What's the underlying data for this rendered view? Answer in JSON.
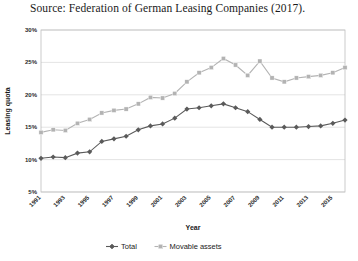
{
  "source": {
    "caption": "Source: Federation of German Leasing Companies (2017)."
  },
  "chart_data": {
    "type": "line",
    "title": "",
    "xlabel": "Year",
    "ylabel": "Leasing quota",
    "ylim": [
      5,
      30
    ],
    "ytick_labels": [
      "30%",
      "25%",
      "20%",
      "15%",
      "10%",
      "5%"
    ],
    "ytick_values": [
      30,
      25,
      20,
      15,
      10,
      5
    ],
    "grid": true,
    "legend_position": "bottom",
    "x_tick_step": 2,
    "x": [
      1991,
      1992,
      1993,
      1994,
      1995,
      1996,
      1997,
      1998,
      1999,
      2000,
      2001,
      2002,
      2003,
      2004,
      2005,
      2006,
      2007,
      2008,
      2009,
      2010,
      2011,
      2012,
      2013,
      2014,
      2015,
      2016
    ],
    "xtick_labels": [
      "1991",
      "1993",
      "1995",
      "1997",
      "1999",
      "2001",
      "2003",
      "2005",
      "2007",
      "2009",
      "2011",
      "2013",
      "2015"
    ],
    "series": [
      {
        "name": "Total",
        "color": "#5a5a5a",
        "marker": "diamond",
        "values": [
          10.2,
          10.4,
          10.3,
          11.0,
          11.2,
          12.8,
          13.2,
          13.6,
          14.6,
          15.2,
          15.5,
          16.4,
          17.8,
          18.0,
          18.3,
          18.6,
          18.0,
          17.4,
          16.2,
          15.0,
          15.0,
          15.0,
          15.1,
          15.2,
          15.6,
          16.1
        ]
      },
      {
        "name": "Movable assets",
        "color": "#b3b3b3",
        "marker": "square",
        "values": [
          14.2,
          14.6,
          14.5,
          15.6,
          16.2,
          17.2,
          17.6,
          17.8,
          18.6,
          19.6,
          19.5,
          20.2,
          22.0,
          23.4,
          24.2,
          25.6,
          24.6,
          23.0,
          25.2,
          22.6,
          22.0,
          22.6,
          22.8,
          23.0,
          23.4,
          24.2
        ]
      }
    ]
  },
  "legend": {
    "items": [
      {
        "label": "Total"
      },
      {
        "label": "Movable assets"
      }
    ]
  }
}
